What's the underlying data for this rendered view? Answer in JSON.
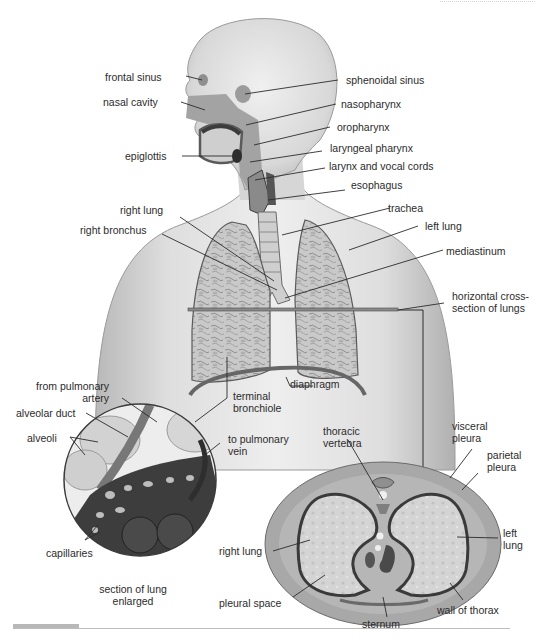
{
  "figure": {
    "colors": {
      "ink": "#2b2b2b",
      "skin": "#d9d9d9",
      "tissue": "#8c8c8c",
      "dark": "#3a3a3a",
      "lung": "#c8c8c8"
    }
  },
  "labels": {
    "frontal_sinus": "frontal sinus",
    "sphenoidal_sinus": "sphenoidal sinus",
    "nasal_cavity": "nasal cavity",
    "nasopharynx": "nasopharynx",
    "oropharynx": "oropharynx",
    "epiglottis": "epiglottis",
    "laryngeal_pharynx": "laryngeal pharynx",
    "larynx_vocal_cords": "larynx and vocal cords",
    "esophagus": "esophagus",
    "trachea": "trachea",
    "right_lung": "right lung",
    "left_lung": "left lung",
    "right_bronchus": "right bronchus",
    "mediastinum": "mediastinum",
    "horizontal_cross_section_1": "horizontal cross-",
    "horizontal_cross_section_2": "section of lungs",
    "diaphragm": "diaphragm",
    "terminal_bronchiole_1": "terminal",
    "terminal_bronchiole_2": "bronchiole",
    "from_pulmonary_artery_1": "from pulmonary",
    "from_pulmonary_artery_2": "artery",
    "alveolar_duct": "alveolar duct",
    "alveoli": "alveoli",
    "to_pulmonary_vein_1": "to pulmonary",
    "to_pulmonary_vein_2": "vein",
    "capillaries": "capillaries",
    "section_enlarged_1": "section of lung",
    "section_enlarged_2": "enlarged",
    "thoracic_vertebra_1": "thoracic",
    "thoracic_vertebra_2": "vertebra",
    "visceral_pleura_1": "visceral",
    "visceral_pleura_2": "pleura",
    "parietal_pleura_1": "parietal",
    "parietal_pleura_2": "pleura",
    "cs_right_lung": "right lung",
    "cs_left_lung_1": "left",
    "cs_left_lung_2": "lung",
    "pleural_space": "pleural space",
    "sternum": "sternum",
    "wall_of_thorax": "wall of thorax"
  }
}
